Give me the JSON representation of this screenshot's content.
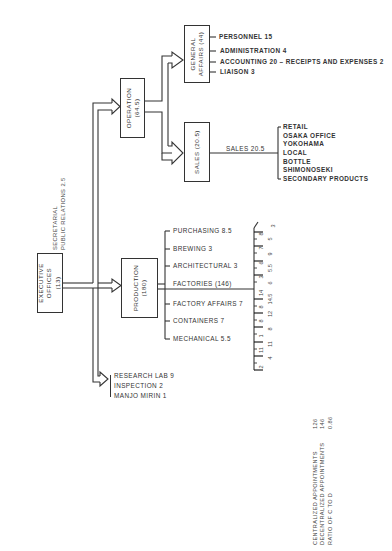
{
  "executive": {
    "label_line1": "EXECUTIVE",
    "label_line2": "OFFICES",
    "label_line3": "(13)",
    "side_line1": "SECRETARIAL",
    "side_line2": "PUBLIC RELATIONS   2.5"
  },
  "operation": {
    "label_line1": "OPERATION",
    "label_line2": "(64.5)"
  },
  "general_affairs": {
    "label_line1": "GENERAL",
    "label_line2": "AFFAIRS (44)",
    "items": [
      "PERSONNEL 15",
      "ADMINISTRATION 4",
      "ACCOUNTING 20 – RECEIPTS AND EXPENSES 2",
      "LIAISON 3"
    ]
  },
  "sales": {
    "label": "SALES (20.5)",
    "link_label": "SALES 20.5",
    "items": [
      "RETAIL",
      "OSAKA OFFICE",
      "YOKOHAMA",
      "LOCAL",
      "BOTTLE",
      "SHIMONOSEKI",
      "SECONDARY PRODUCTS"
    ]
  },
  "production": {
    "label_line1": "PRODUCTION",
    "label_line2": "(180)",
    "items": [
      "PURCHASING  8.5",
      "BREWING  3",
      "ARCHITECTURAL  3",
      "FACTORIES  (146)",
      "FACTORY AFFAIRS  7",
      "CONTAINERS  7",
      "MECHANICAL  5.5"
    ]
  },
  "factories": {
    "top_value": "3",
    "col_a": [
      "8",
      "7",
      "6",
      "3",
      "14",
      "8",
      "8",
      "1",
      "11",
      "2"
    ],
    "col_b": [
      "5",
      "9",
      "5.5",
      "6",
      "14.5",
      "12",
      "8",
      "11",
      "4"
    ]
  },
  "other_units": {
    "items": [
      "RESEARCH LAB 9",
      "INSPECTION 2",
      "MANJO MIRIN 1"
    ]
  },
  "summary": {
    "rows": [
      {
        "label": "CENTRALIZED APPOINTMENTS",
        "value": "126"
      },
      {
        "label": "DECENTRALIZED APPOINTMENTS",
        "value": "146"
      },
      {
        "label": "RATIO OF C TO D",
        "value": "0.86"
      }
    ]
  }
}
